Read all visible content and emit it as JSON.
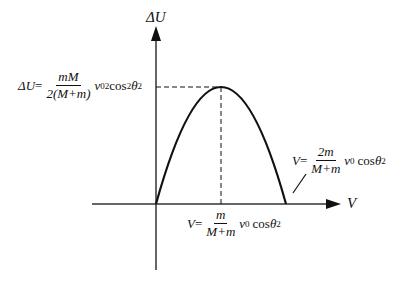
{
  "diagram": {
    "y_axis_label": "ΔU",
    "x_axis_label": "V",
    "peak_label": {
      "lhs": "ΔU",
      "eq": "=",
      "numerator": "mM",
      "denominator": "2(M+m)",
      "tail_v": "v",
      "tail_v_sub": "0",
      "tail_v_sup": "2",
      "tail_cos": "cos",
      "tail_cos_sup": "2",
      "tail_theta": "θ",
      "tail_theta_sub": "2"
    },
    "vertex_v_label": {
      "lhs": "V",
      "eq": "=",
      "numerator": "m",
      "denominator": "M+m",
      "tail_v": "v",
      "tail_v_sub": "0",
      "tail_cos": "cos",
      "tail_theta": "θ",
      "tail_theta_sub": "2"
    },
    "root_v_label": {
      "lhs": "V",
      "eq": "=",
      "numerator": "2m",
      "denominator": "M+m",
      "tail_v": "v",
      "tail_v_sub": "0",
      "tail_cos": "cos",
      "tail_theta": "θ",
      "tail_theta_sub": "2"
    },
    "curve": {
      "type": "inverted-parabola",
      "start": [
        0,
        0
      ],
      "vertex": [
        "m/(M+m)·v0·cosθ2",
        "mM/(2(M+m))·v0²cos²θ2"
      ],
      "end": [
        "2m/(M+m)·v0·cosθ2",
        0
      ]
    },
    "stroke_color": "#111111"
  }
}
